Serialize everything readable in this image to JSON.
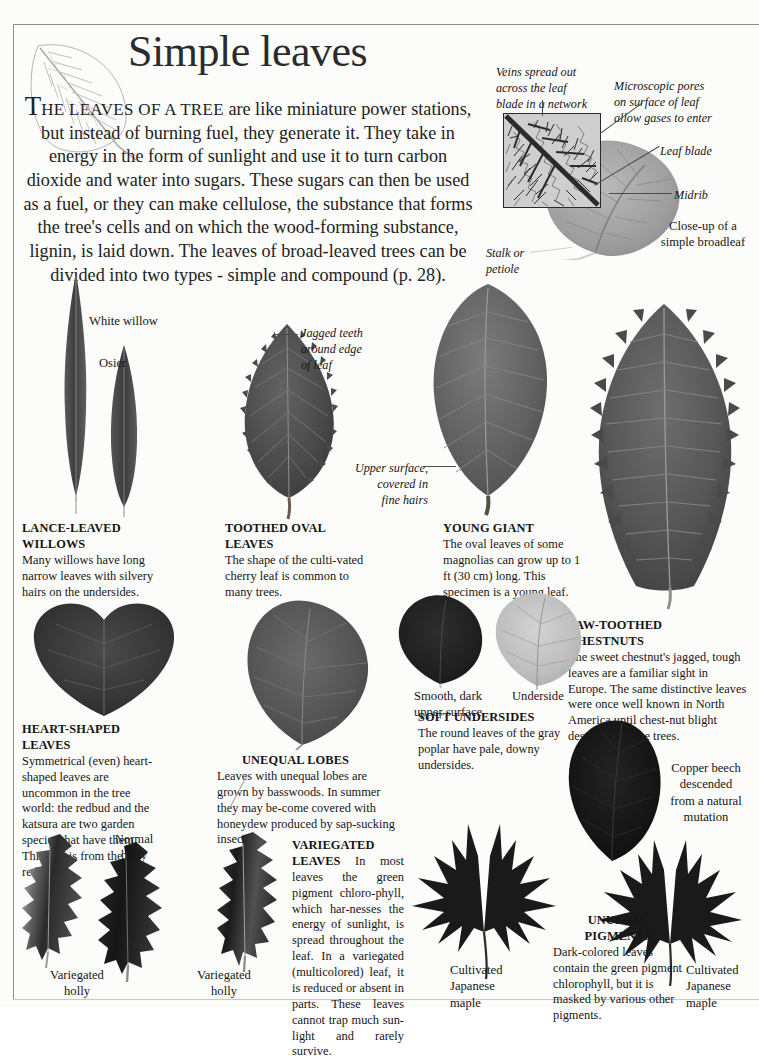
{
  "page": {
    "title": "Simple leaves",
    "background_color": "#fcfcfa",
    "text_color": "#161616",
    "frame_color": "#8d8d8d"
  },
  "intro": {
    "dropcap": "T",
    "smallcaps": "HE LEAVES OF A TREE",
    "body": " are like miniature power stations, but instead of burning fuel, they generate it. They take in energy in the form of sunlight and use it to turn carbon dioxide and water into sugars. These sugars can then be used as a fuel, or they can make cellulose, the substance that forms the tree's cells and on which the wood-forming substance, lignin, is laid down. The leaves of broad-leaved trees can be divided into two types - simple and compound (p. 28)."
  },
  "diagram": {
    "veins_label": "Veins spread out\nacross the leaf\nblade in a network",
    "pores_label": "Microscopic pores\non surface of leaf\nallow gases to enter",
    "leaf_blade_label": "Leaf  blade",
    "midrib_label": "Midrib",
    "closeup_caption": "Close-up of a\nsimple broadleaf",
    "stalk_label": "Stalk or\npetiole"
  },
  "specimens": {
    "white_willow": "White  willow",
    "osier": "Osier",
    "jagged_teeth": "Jagged  teeth\naround edge\nof leaf",
    "upper_surface": "Upper surface,\ncovered in\nfine  hairs",
    "smooth_dark": "Smooth, dark\nupper surface",
    "underside": "Underside",
    "copper_beech": "Copper beech\ndescended\nfrom a natural\nmutation",
    "normal_holly": "Normal\nholly",
    "variegated_holly_left": "Variegated\nholly",
    "variegated_holly_right": "Variegated\nholly",
    "cultivated_japanese_maple_left": "Cultivated\nJapanese\nmaple",
    "cultivated_japanese_maple_right": "Cultivated\nJapanese\nmaple"
  },
  "captions": [
    {
      "id": "lance-leaved-willows",
      "heading": "LANCE-LEAVED WILLOWS",
      "body": "Many willows have long narrow leaves with silvery hairs on the undersides."
    },
    {
      "id": "toothed-oval-leaves",
      "heading": "TOOTHED OVAL LEAVES",
      "body": "The shape of the culti-vated cherry leaf is common to many trees."
    },
    {
      "id": "young-giant",
      "heading": "YOUNG GIANT",
      "body": "The oval leaves of some magnolias can grow up to 1 ft (30 cm) long. This specimen is a young leaf."
    },
    {
      "id": "saw-toothed-chestnuts",
      "heading": "SAW-TOOTHED\nCHESTNUTS",
      "body": "The sweet chestnut's jagged, tough leaves are a familiar sight in Europe. The same distinctive leaves were once well known in North America until chest-nut blight destroyed all the trees."
    },
    {
      "id": "heart-shaped-leaves",
      "heading": "HEART-SHAPED LEAVES",
      "body": "Symmetrical (even) heart-shaped leaves are uncommon in the tree world: the redbud and the katsura are two garden species that have them. This leaf is from the redbud."
    },
    {
      "id": "unequal-lobes",
      "heading": "UNEQUAL LOBES",
      "body": "Leaves with unequal lobes are grown by basswoods. In summer they may be-come covered with honeydew produced by sap-sucking insects."
    },
    {
      "id": "soft-undersides",
      "heading": "SOFT UNDERSIDES",
      "body": "The round leaves of the gray poplar have pale, downy undersides."
    },
    {
      "id": "variegated-leaves",
      "heading": "VARIEGATED LEAVES",
      "body": "In most leaves the green pigment chloro-phyll, which har-nesses the energy of sunlight, is spread throughout the leaf. In a variegated (multicolored) leaf, it is reduced or absent in parts. These leaves cannot trap much sun-light and rarely survive."
    },
    {
      "id": "unusual-pigments",
      "heading": "UNUSUAL\nPIGMENTS",
      "body": "Dark-colored leaves contain the green pigment chlorophyll, but it is masked by various other pigments."
    }
  ]
}
